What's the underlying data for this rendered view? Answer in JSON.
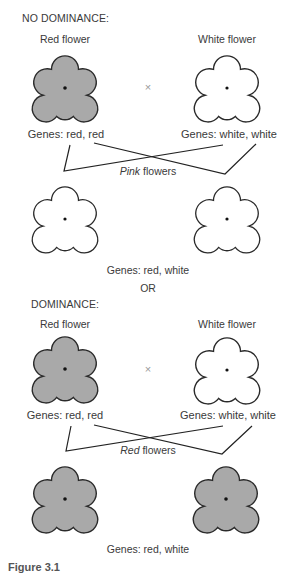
{
  "colors": {
    "red_flower_fill": "#a9a9a9",
    "white_flower_fill": "#ffffff",
    "outline": "#2a2a2a",
    "line": "#222222"
  },
  "sections": [
    {
      "header": "NO DOMINANCE:",
      "parent_left_label": "Red flower",
      "parent_right_label": "White flower",
      "cross_symbol": "×",
      "parent_left_genes": "Genes: red, red",
      "parent_right_genes": "Genes: white, white",
      "offspring_label_emph": "Pink",
      "offspring_label_rest": " flowers",
      "offspring_genes": "Genes: red, white",
      "offspring_color": "white"
    },
    {
      "header": "DOMINANCE:",
      "parent_left_label": "Red flower",
      "parent_right_label": "White flower",
      "cross_symbol": "×",
      "parent_left_genes": "Genes: red, red",
      "parent_right_genes": "Genes: white, white",
      "offspring_label_emph": "Red",
      "offspring_label_rest": " flowers",
      "offspring_genes": "Genes: red, white",
      "offspring_color": "red"
    }
  ],
  "separator": "OR",
  "caption": "Figure 3.1"
}
